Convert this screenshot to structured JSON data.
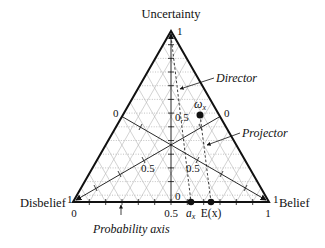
{
  "diagram": {
    "type": "ternary opinion triangle",
    "vertices": {
      "top": {
        "label": "Uncertainty",
        "value": "1"
      },
      "left": {
        "label": "Disbelief",
        "value": "1"
      },
      "right": {
        "label": "Belief",
        "value": "1"
      }
    },
    "axis_labels": {
      "left_edge_zero": "0",
      "right_edge_zero": "0",
      "uncertainty_half": "0.5",
      "uncertainty_zero": "0",
      "disbelief_half": "0.5",
      "belief_half": "0.5"
    },
    "base_axis": {
      "name": "Probability axis",
      "ticks": [
        "0",
        "0.5",
        "1"
      ]
    },
    "points": {
      "opinion": {
        "label": "ω",
        "subscript": "x"
      },
      "base_rate": {
        "label": "a",
        "subscript": "x"
      },
      "expectation": {
        "label": "E(x)"
      }
    },
    "annotations": {
      "director": "Director",
      "projector": "Projector"
    }
  }
}
